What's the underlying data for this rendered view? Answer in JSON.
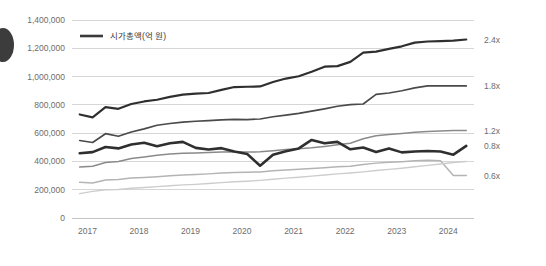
{
  "chart_data": {
    "type": "line",
    "title": "",
    "xlabel": "",
    "ylabel": "",
    "ylim": [
      0,
      1400000
    ],
    "grid": true,
    "legend_position": "top-left",
    "y_ticks": [
      "0",
      "200,000",
      "400,000",
      "600,000",
      "800,000",
      "1,000,000",
      "1,200,000",
      "1,400,000"
    ],
    "y_tick_values": [
      0,
      200000,
      400000,
      600000,
      800000,
      1000000,
      1200000,
      1400000
    ],
    "x_ticks": [
      "2017",
      "2018",
      "2019",
      "2020",
      "2021",
      "2022",
      "2023",
      "2024"
    ],
    "x_tick_values": [
      2017,
      2018,
      2019,
      2020,
      2021,
      2022,
      2023,
      2024
    ],
    "legend": [
      {
        "label": "시가총액(억 원)",
        "color": "#3a3a3a"
      }
    ],
    "end_labels": [
      "2.4x",
      "1.8x",
      "1.2x",
      "0.8x",
      "0.6x"
    ],
    "x": [
      2016.85,
      2017.1,
      2017.35,
      2017.6,
      2017.85,
      2018.1,
      2018.35,
      2018.6,
      2018.85,
      2019.1,
      2019.35,
      2019.6,
      2019.85,
      2020.1,
      2020.35,
      2020.6,
      2020.85,
      2021.1,
      2021.35,
      2021.6,
      2021.85,
      2022.1,
      2022.35,
      2022.6,
      2022.85,
      2023.1,
      2023.35,
      2023.6,
      2023.85,
      2024.1,
      2024.35
    ],
    "series": [
      {
        "name": "2.4x",
        "end_label": "2.4x",
        "color": "#2f2f2f",
        "width": 2.2,
        "values": [
          732000,
          712000,
          784000,
          772000,
          806000,
          824000,
          836000,
          856000,
          872000,
          880000,
          884000,
          906000,
          926000,
          928000,
          930000,
          962000,
          986000,
          1002000,
          1034000,
          1070000,
          1074000,
          1104000,
          1170000,
          1176000,
          1196000,
          1214000,
          1240000,
          1248000,
          1250000,
          1254000,
          1262000
        ]
      },
      {
        "name": "1.8x",
        "end_label": "1.8x",
        "color": "#4a4a4a",
        "width": 1.7,
        "values": [
          548000,
          534000,
          596000,
          578000,
          608000,
          630000,
          656000,
          668000,
          678000,
          684000,
          688000,
          694000,
          698000,
          696000,
          700000,
          716000,
          728000,
          740000,
          756000,
          772000,
          790000,
          802000,
          806000,
          874000,
          884000,
          900000,
          920000,
          934000,
          934000,
          934000,
          934000
        ]
      },
      {
        "name": "1.2x",
        "end_label": "1.2x",
        "color": "#8a8a8a",
        "width": 1.5,
        "values": [
          360000,
          366000,
          392000,
          400000,
          420000,
          432000,
          444000,
          452000,
          458000,
          460000,
          464000,
          466000,
          468000,
          466000,
          468000,
          476000,
          484000,
          490000,
          496000,
          506000,
          518000,
          528000,
          560000,
          582000,
          590000,
          598000,
          606000,
          612000,
          616000,
          618000,
          618000
        ]
      },
      {
        "name": "0.8x",
        "end_label": "0.8x",
        "color": "#2f2f2f",
        "width": 2.6,
        "values": [
          458000,
          466000,
          502000,
          492000,
          520000,
          532000,
          508000,
          528000,
          538000,
          496000,
          484000,
          494000,
          470000,
          452000,
          370000,
          448000,
          472000,
          492000,
          552000,
          528000,
          538000,
          486000,
          498000,
          466000,
          492000,
          464000,
          470000,
          474000,
          470000,
          448000,
          510000
        ]
      },
      {
        "name": "0.6x",
        "end_label": "0.6x",
        "color": "#b4b4b4",
        "width": 1.5,
        "values": [
          252000,
          248000,
          268000,
          272000,
          282000,
          286000,
          292000,
          298000,
          304000,
          308000,
          312000,
          318000,
          322000,
          324000,
          326000,
          334000,
          340000,
          344000,
          350000,
          356000,
          362000,
          366000,
          378000,
          388000,
          394000,
          398000,
          404000,
          408000,
          404000,
          300000,
          300000
        ]
      },
      {
        "name": "lowest",
        "end_label": "",
        "color": "#cdcdcd",
        "width": 1.4,
        "values": [
          172000,
          188000,
          200000,
          202000,
          210000,
          216000,
          222000,
          228000,
          234000,
          238000,
          244000,
          250000,
          256000,
          260000,
          266000,
          274000,
          282000,
          288000,
          296000,
          304000,
          312000,
          318000,
          326000,
          336000,
          344000,
          352000,
          362000,
          372000,
          382000,
          392000,
          400000
        ]
      }
    ]
  },
  "legend": {
    "label": "시가총액(억 원)"
  }
}
